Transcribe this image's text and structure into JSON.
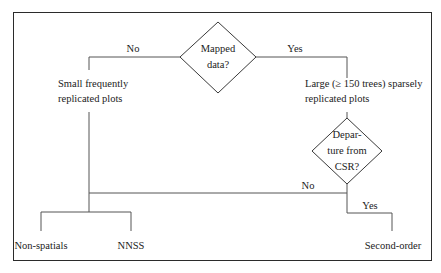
{
  "diagram": {
    "type": "decision-flowchart",
    "decisions": {
      "mapped_data": {
        "label_line1": "Mapped",
        "label_line2": "data?",
        "no_label": "No",
        "yes_label": "Yes"
      },
      "departure_from_csr": {
        "label_line1": "Depar-",
        "label_line2": "ture from",
        "label_line3": "CSR?",
        "no_label": "No",
        "yes_label": "Yes"
      }
    },
    "nodes": {
      "small_plots": {
        "line1": "Small frequently",
        "line2": "replicated plots"
      },
      "large_plots": {
        "line1": "Large (≥ 150 trees) sparsely",
        "line2": "replicated plots"
      }
    },
    "outcomes": {
      "non_spatials": "Non-spatials",
      "nnss": "NNSS",
      "second_order": "Second-order"
    },
    "colors": {
      "line": "#555555",
      "frame": "#2b2b2b",
      "text": "#222222",
      "background": "#ffffff"
    }
  }
}
